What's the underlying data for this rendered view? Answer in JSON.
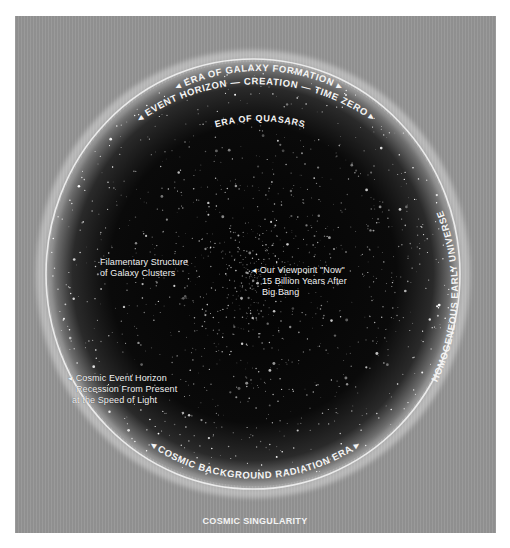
{
  "diagram": {
    "colors": {
      "background": "#959595",
      "universe_interior": "#050505",
      "ring": "#f0f0f0",
      "text": "#f4f4f4"
    },
    "arc_labels": {
      "outer_top": "EVENT HORIZON — CREATION — TIME ZERO",
      "inner_top": "ERA OF GALAXY FORMATION",
      "quasars": "ERA OF QUASARS",
      "right_side": "HOMOGENEOUS EARLY UNIVERSE",
      "bottom": "COSMIC BACKGROUND RADIATION ERA"
    },
    "labels": {
      "filamentary": [
        "Filamentary Structure",
        "of Galaxy Clusters"
      ],
      "viewpoint": [
        "Our Viewpoint \"Now\"",
        "15 Billion Years After",
        "Big Bang"
      ],
      "event_horizon": [
        "Cosmic Event Horizon",
        "Recession From Present",
        "at the Speed of Light"
      ]
    },
    "caption": "COSMIC SINGULARITY",
    "icons": {
      "arrow_left": "◂",
      "arrow_right": "▸"
    }
  }
}
